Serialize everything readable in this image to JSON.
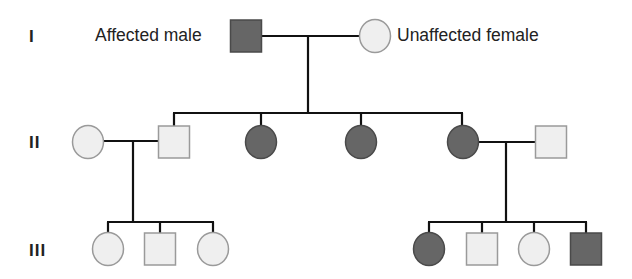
{
  "colors": {
    "affected_fill": "#666666",
    "affected_stroke": "#4a4a4a",
    "unaffected_fill": "#efefef",
    "unaffected_stroke": "#9a9a9a",
    "line": "#111111"
  },
  "legend": {
    "affected_male": "Affected male",
    "unaffected_female": "Unaffected female"
  },
  "generations": [
    {
      "label": "I",
      "y": 36
    },
    {
      "label": "II",
      "y": 142
    },
    {
      "label": "III",
      "y": 249
    }
  ],
  "individuals": [
    {
      "id": "I-1",
      "gen": "I",
      "sex": "male",
      "affected": true,
      "cx": 246,
      "cy": 36
    },
    {
      "id": "I-2",
      "gen": "I",
      "sex": "female",
      "affected": false,
      "cx": 375,
      "cy": 36
    },
    {
      "id": "II-1",
      "gen": "II",
      "sex": "female",
      "affected": false,
      "cx": 88,
      "cy": 142
    },
    {
      "id": "II-2",
      "gen": "II",
      "sex": "male",
      "affected": false,
      "cx": 174,
      "cy": 142
    },
    {
      "id": "II-3",
      "gen": "II",
      "sex": "female",
      "affected": true,
      "cx": 261,
      "cy": 142
    },
    {
      "id": "II-4",
      "gen": "II",
      "sex": "female",
      "affected": true,
      "cx": 361,
      "cy": 142
    },
    {
      "id": "II-5",
      "gen": "II",
      "sex": "female",
      "affected": true,
      "cx": 463,
      "cy": 142
    },
    {
      "id": "II-6",
      "gen": "II",
      "sex": "male",
      "affected": false,
      "cx": 551,
      "cy": 142
    },
    {
      "id": "III-1",
      "gen": "III",
      "sex": "female",
      "affected": false,
      "cx": 108,
      "cy": 249
    },
    {
      "id": "III-2",
      "gen": "III",
      "sex": "male",
      "affected": false,
      "cx": 160,
      "cy": 249
    },
    {
      "id": "III-3",
      "gen": "III",
      "sex": "female",
      "affected": false,
      "cx": 213,
      "cy": 249
    },
    {
      "id": "III-4",
      "gen": "III",
      "sex": "female",
      "affected": true,
      "cx": 429,
      "cy": 249
    },
    {
      "id": "III-5",
      "gen": "III",
      "sex": "male",
      "affected": false,
      "cx": 482,
      "cy": 249
    },
    {
      "id": "III-6",
      "gen": "III",
      "sex": "female",
      "affected": false,
      "cx": 534,
      "cy": 249
    },
    {
      "id": "III-7",
      "gen": "III",
      "sex": "male",
      "affected": true,
      "cx": 586,
      "cy": 249
    }
  ],
  "lines": [
    {
      "name": "mating-I",
      "x1": 262,
      "y1": 36,
      "x2": 359,
      "y2": 36
    },
    {
      "name": "descent-I",
      "x1": 308,
      "y1": 36,
      "x2": 308,
      "y2": 113
    },
    {
      "name": "sibship-II",
      "x1": 173,
      "y1": 113,
      "x2": 463,
      "y2": 113
    },
    {
      "name": "drop-II-2",
      "x1": 174,
      "y1": 113,
      "x2": 174,
      "y2": 126
    },
    {
      "name": "drop-II-3",
      "x1": 261,
      "y1": 113,
      "x2": 261,
      "y2": 126
    },
    {
      "name": "drop-II-4",
      "x1": 361,
      "y1": 113,
      "x2": 361,
      "y2": 126
    },
    {
      "name": "drop-II-5",
      "x1": 462,
      "y1": 113,
      "x2": 462,
      "y2": 126
    },
    {
      "name": "mating-II-left",
      "x1": 104,
      "y1": 141,
      "x2": 158,
      "y2": 141
    },
    {
      "name": "descent-II-left",
      "x1": 133,
      "y1": 141,
      "x2": 133,
      "y2": 222
    },
    {
      "name": "sibship-III-left",
      "x1": 107,
      "y1": 222,
      "x2": 214,
      "y2": 222
    },
    {
      "name": "drop-III-1",
      "x1": 108,
      "y1": 222,
      "x2": 108,
      "y2": 233
    },
    {
      "name": "drop-III-2",
      "x1": 160,
      "y1": 222,
      "x2": 160,
      "y2": 233
    },
    {
      "name": "drop-III-3",
      "x1": 213,
      "y1": 222,
      "x2": 213,
      "y2": 233
    },
    {
      "name": "mating-II-right",
      "x1": 479,
      "y1": 142,
      "x2": 535,
      "y2": 142
    },
    {
      "name": "descent-II-right",
      "x1": 506,
      "y1": 142,
      "x2": 506,
      "y2": 222
    },
    {
      "name": "sibship-III-right",
      "x1": 428,
      "y1": 222,
      "x2": 587,
      "y2": 222
    },
    {
      "name": "drop-III-4",
      "x1": 429,
      "y1": 222,
      "x2": 429,
      "y2": 233
    },
    {
      "name": "drop-III-5",
      "x1": 482,
      "y1": 222,
      "x2": 482,
      "y2": 233
    },
    {
      "name": "drop-III-6",
      "x1": 534,
      "y1": 222,
      "x2": 534,
      "y2": 233
    },
    {
      "name": "drop-III-7",
      "x1": 586,
      "y1": 222,
      "x2": 586,
      "y2": 233
    }
  ]
}
